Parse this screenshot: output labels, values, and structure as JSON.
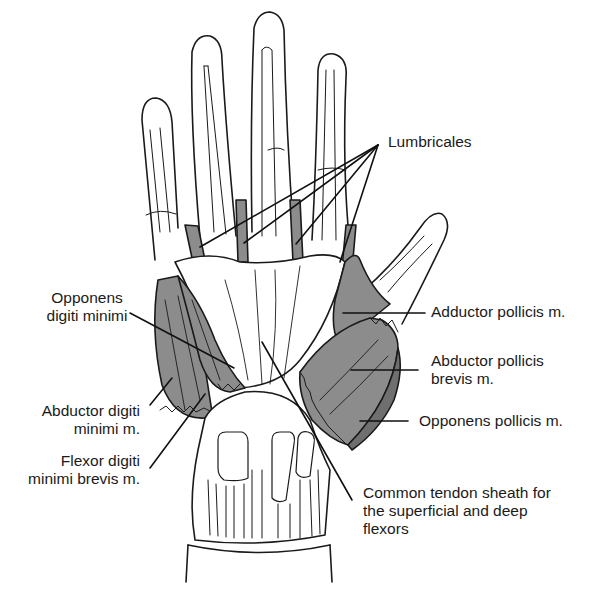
{
  "figure": {
    "colors": {
      "muscle_fill": "#8c8c8c",
      "outline": "#1a1a1a",
      "background": "#ffffff"
    }
  },
  "labels": {
    "lumbricales": {
      "lines": [
        "Lumbricales"
      ]
    },
    "opponens_digiti_minimi": {
      "lines": [
        "Opponens",
        "digiti minimi"
      ]
    },
    "adductor_pollicis": {
      "lines": [
        "Adductor pollicis m."
      ]
    },
    "abductor_pollicis_brevis": {
      "lines": [
        "Abductor pollicis",
        "brevis m."
      ]
    },
    "opponens_pollicis": {
      "lines": [
        "Opponens pollicis m."
      ]
    },
    "abductor_digiti_minimi": {
      "lines": [
        "Abductor digiti",
        "minimi m."
      ]
    },
    "flexor_digiti_minimi_brevis": {
      "lines": [
        "Flexor digiti",
        "minimi brevis m."
      ]
    },
    "common_tendon_sheath": {
      "lines": [
        "Common tendon sheath for",
        "the superficial and deep",
        "flexors"
      ]
    }
  }
}
